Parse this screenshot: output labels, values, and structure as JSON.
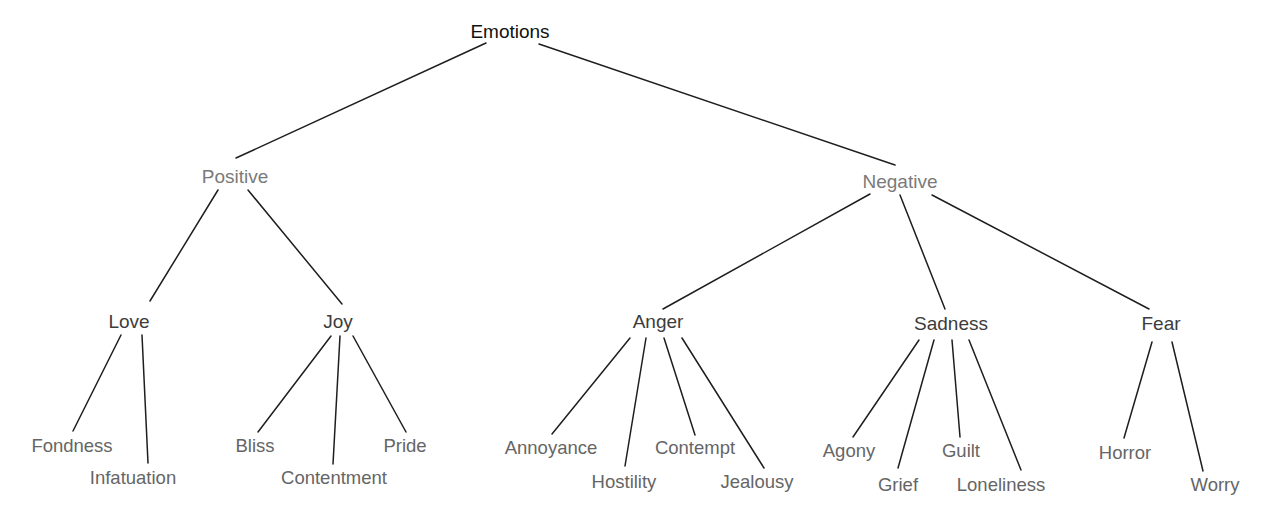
{
  "diagram": {
    "title": "Emotions",
    "colors": {
      "edge": "#1e1e1e",
      "root": "#111111",
      "category": "#7a7a7a",
      "primary": "#3c3c3c",
      "secondary": "#656565"
    },
    "nodes": {
      "emotions": {
        "label": "Emotions",
        "level": 0,
        "cx": 510,
        "y": 38
      },
      "positive": {
        "label": "Positive",
        "level": 1,
        "cx": 235,
        "y": 183
      },
      "negative": {
        "label": "Negative",
        "level": 1,
        "cx": 900,
        "y": 188
      },
      "love": {
        "label": "Love",
        "level": 2,
        "cx": 129,
        "y": 328
      },
      "joy": {
        "label": "Joy",
        "level": 2,
        "cx": 338,
        "y": 328
      },
      "anger": {
        "label": "Anger",
        "level": 2,
        "cx": 658,
        "y": 328
      },
      "sadness": {
        "label": "Sadness",
        "level": 2,
        "cx": 951,
        "y": 330
      },
      "fear": {
        "label": "Fear",
        "level": 2,
        "cx": 1161,
        "y": 330
      },
      "fondness": {
        "label": "Fondness",
        "level": 3,
        "cx": 72,
        "y": 452
      },
      "infatuation": {
        "label": "Infatuation",
        "level": 3,
        "cx": 133,
        "y": 484
      },
      "bliss": {
        "label": "Bliss",
        "level": 3,
        "cx": 255,
        "y": 452
      },
      "contentment": {
        "label": "Contentment",
        "level": 3,
        "cx": 334,
        "y": 484
      },
      "pride": {
        "label": "Pride",
        "level": 3,
        "cx": 405,
        "y": 452
      },
      "annoyance": {
        "label": "Annoyance",
        "level": 3,
        "cx": 551,
        "y": 454
      },
      "hostility": {
        "label": "Hostility",
        "level": 3,
        "cx": 624,
        "y": 488
      },
      "contempt": {
        "label": "Contempt",
        "level": 3,
        "cx": 695,
        "y": 454
      },
      "jealousy": {
        "label": "Jealousy",
        "level": 3,
        "cx": 757,
        "y": 488
      },
      "agony": {
        "label": "Agony",
        "level": 3,
        "cx": 849,
        "y": 457
      },
      "grief": {
        "label": "Grief",
        "level": 3,
        "cx": 898,
        "y": 491
      },
      "guilt": {
        "label": "Guilt",
        "level": 3,
        "cx": 961,
        "y": 457
      },
      "loneliness": {
        "label": "Loneliness",
        "level": 3,
        "cx": 1001,
        "y": 491
      },
      "horror": {
        "label": "Horror",
        "level": 3,
        "cx": 1125,
        "y": 459
      },
      "worry": {
        "label": "Worry",
        "level": 3,
        "cx": 1215,
        "y": 491
      }
    },
    "edges": [
      {
        "from": "emotions",
        "to": "positive",
        "x1": 486,
        "y1": 43,
        "x2": 236,
        "y2": 158
      },
      {
        "from": "emotions",
        "to": "negative",
        "x1": 539,
        "y1": 44,
        "x2": 895,
        "y2": 165
      },
      {
        "from": "positive",
        "to": "love",
        "x1": 218,
        "y1": 190,
        "x2": 150,
        "y2": 301
      },
      {
        "from": "positive",
        "to": "joy",
        "x1": 248,
        "y1": 190,
        "x2": 342,
        "y2": 304
      },
      {
        "from": "negative",
        "to": "anger",
        "x1": 870,
        "y1": 194,
        "x2": 663,
        "y2": 309
      },
      {
        "from": "negative",
        "to": "sadness",
        "x1": 900,
        "y1": 195,
        "x2": 945,
        "y2": 309
      },
      {
        "from": "negative",
        "to": "fear",
        "x1": 932,
        "y1": 195,
        "x2": 1149,
        "y2": 309
      },
      {
        "from": "love",
        "to": "fondness",
        "x1": 121,
        "y1": 335,
        "x2": 73,
        "y2": 431
      },
      {
        "from": "love",
        "to": "infatuation",
        "x1": 142,
        "y1": 335,
        "x2": 148,
        "y2": 463
      },
      {
        "from": "joy",
        "to": "bliss",
        "x1": 331,
        "y1": 336,
        "x2": 258,
        "y2": 432
      },
      {
        "from": "joy",
        "to": "contentment",
        "x1": 340,
        "y1": 336,
        "x2": 333,
        "y2": 464
      },
      {
        "from": "joy",
        "to": "pride",
        "x1": 353,
        "y1": 336,
        "x2": 406,
        "y2": 432
      },
      {
        "from": "anger",
        "to": "annoyance",
        "x1": 630,
        "y1": 338,
        "x2": 552,
        "y2": 434
      },
      {
        "from": "anger",
        "to": "hostility",
        "x1": 646,
        "y1": 338,
        "x2": 625,
        "y2": 466
      },
      {
        "from": "anger",
        "to": "contempt",
        "x1": 664,
        "y1": 338,
        "x2": 695,
        "y2": 435
      },
      {
        "from": "anger",
        "to": "jealousy",
        "x1": 682,
        "y1": 338,
        "x2": 764,
        "y2": 468
      },
      {
        "from": "sadness",
        "to": "agony",
        "x1": 919,
        "y1": 340,
        "x2": 853,
        "y2": 437
      },
      {
        "from": "sadness",
        "to": "grief",
        "x1": 934,
        "y1": 340,
        "x2": 898,
        "y2": 468
      },
      {
        "from": "sadness",
        "to": "guilt",
        "x1": 952,
        "y1": 340,
        "x2": 960,
        "y2": 437
      },
      {
        "from": "sadness",
        "to": "loneliness",
        "x1": 969,
        "y1": 340,
        "x2": 1021,
        "y2": 470
      },
      {
        "from": "fear",
        "to": "horror",
        "x1": 1152,
        "y1": 342,
        "x2": 1124,
        "y2": 438
      },
      {
        "from": "fear",
        "to": "worry",
        "x1": 1172,
        "y1": 342,
        "x2": 1203,
        "y2": 471
      }
    ]
  }
}
